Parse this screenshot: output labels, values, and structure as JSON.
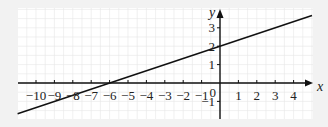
{
  "chart_data": {
    "type": "line",
    "title": "",
    "xlabel": "x",
    "ylabel": "y",
    "xlim": [
      -11,
      5
    ],
    "ylim": [
      -2,
      4
    ],
    "grid": true,
    "x_ticks": [
      -10,
      -9,
      -8,
      -7,
      -6,
      -5,
      -4,
      -3,
      -2,
      -1,
      1,
      2,
      3,
      4
    ],
    "x_tick_labels": [
      "−10",
      "−9",
      "−8",
      "−7",
      "−6",
      "−5",
      "−4",
      "−3",
      "−2",
      "−1",
      "1",
      "2",
      "3",
      "4"
    ],
    "y_ticks": [
      -1,
      1,
      2,
      3
    ],
    "y_tick_labels": [
      "−1",
      "1",
      "2",
      "3"
    ],
    "origin_label": "0",
    "series": [
      {
        "name": "line",
        "equation": "y = x/3 + 2",
        "slope": 0.3333,
        "intercept": 2,
        "x_intercept": -6,
        "x": [
          -11,
          -6,
          0,
          5
        ],
        "y": [
          -1.667,
          0,
          2,
          3.667
        ]
      }
    ],
    "colors": {
      "background": "#f2f2f2",
      "plot_area": "#ffffff",
      "grid": "#e6e6e6",
      "line": "#111111"
    }
  }
}
